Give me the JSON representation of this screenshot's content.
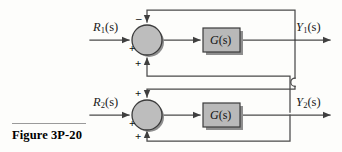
{
  "figure": {
    "caption": "Figure 3P-20",
    "type": "control-system-block-diagram"
  },
  "colors": {
    "line": "#4a4a4a",
    "block_fill": "#b9b9b9",
    "block_border": "#3b3b3b",
    "junction_fill": "#bdbdbd",
    "junction_border": "#3b3b3b",
    "shadow": "#8e8e8e",
    "text": "#1a1a1a",
    "rule": "#9a9a9a",
    "background": "#fdfdfb"
  },
  "inputs": [
    {
      "id": "r1",
      "base": "R",
      "sub": "1",
      "arg": "(s)",
      "full": "R1(s)"
    },
    {
      "id": "r2",
      "base": "R",
      "sub": "2",
      "arg": "(s)",
      "full": "R2(s)"
    }
  ],
  "outputs": [
    {
      "id": "y1",
      "base": "Y",
      "sub": "1",
      "arg": "(s)",
      "full": "Y1(s)"
    },
    {
      "id": "y2",
      "base": "Y",
      "sub": "2",
      "arg": "(s)",
      "full": "Y2(s)"
    }
  ],
  "blocks": [
    {
      "id": "g-top",
      "base": "G",
      "arg": "(s)",
      "full": "G(s)"
    },
    {
      "id": "g-bottom",
      "base": "G",
      "arg": "(s)",
      "full": "G(s)"
    }
  ],
  "junctions": [
    {
      "id": "sum-top",
      "signs": {
        "top": "–",
        "left": "+",
        "bottom": "+"
      }
    },
    {
      "id": "sum-bottom",
      "signs": {
        "top": "+",
        "left": "+",
        "bottom": "+"
      }
    }
  ],
  "signs": {
    "minus": "–",
    "plus": "+"
  }
}
